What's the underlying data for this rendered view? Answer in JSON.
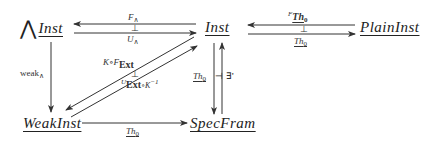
{
  "diagram": {
    "type": "commutative-diagram",
    "nodes": {
      "big_wedge_inst": {
        "prefix": "⋀",
        "label": "Inst"
      },
      "inst": {
        "label": "Inst"
      },
      "plain_inst": {
        "label": "PlainInst"
      },
      "weak_inst": {
        "label": "WeakInst"
      },
      "spec_fram": {
        "label": "SpecFram"
      }
    },
    "edges": {
      "f_wedge": {
        "from": "Inst",
        "to": "⋀Inst",
        "label": "F",
        "sub": "∧"
      },
      "u_wedge": {
        "from": "⋀Inst",
        "to": "Inst",
        "label": "U",
        "sub": "∧"
      },
      "adjoint_top_left": "⊥",
      "f_th0": {
        "from": "PlainInst",
        "to": "Inst",
        "sup": "F",
        "label": "Th",
        "sub": "0"
      },
      "th0_top_right": {
        "from": "Inst",
        "to": "PlainInst",
        "label": "Th",
        "sub": "0"
      },
      "adjoint_top_right": "⊥",
      "weak_wedge": {
        "from": "⋀Inst",
        "to": "WeakInst",
        "label": "weak",
        "sub": "∧"
      },
      "k_f_ext": {
        "from": "Inst",
        "to": "WeakInst",
        "pre": "K∘F",
        "bold": "Ext"
      },
      "u_ext_k_inv": {
        "from": "WeakInst",
        "to": "Inst",
        "sup": "U",
        "bold": "Ext",
        "post": "∘K",
        "post_sup": "−1"
      },
      "adjoint_diag": "⊥",
      "th0_vertical": {
        "from": "Inst",
        "to": "SpecFram",
        "label": "Th",
        "sub": "0"
      },
      "exists_prime": {
        "from": "SpecFram",
        "to": "Inst",
        "label": "∃'"
      },
      "adjoint_vertical": "⊣",
      "th0_bottom": {
        "from": "WeakInst",
        "to": "SpecFram",
        "label": "Th",
        "sub": "0"
      }
    }
  }
}
